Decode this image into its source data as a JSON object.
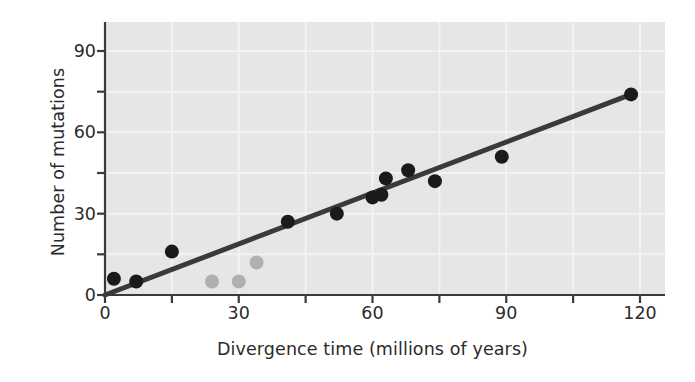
{
  "chart_data": {
    "type": "scatter",
    "title": "",
    "xlabel": "Divergence time (millions of years)",
    "ylabel": "Number of mutations",
    "xlim": [
      0,
      130
    ],
    "ylim": [
      0,
      100
    ],
    "xticks": [
      0,
      15,
      30,
      45,
      60,
      75,
      90,
      105,
      120
    ],
    "xtick_labels": [
      "0",
      "",
      "30",
      "",
      "60",
      "",
      "90",
      "",
      "120"
    ],
    "yticks": [
      0,
      15,
      30,
      45,
      60,
      75,
      90
    ],
    "ytick_labels": [
      "0",
      "",
      "30",
      "",
      "60",
      "",
      "90"
    ],
    "grid": true,
    "grid_color": "#f2f2f2",
    "plot_background": "#e6e6e6",
    "series": [
      {
        "name": "primate comparisons",
        "marker": "filled-circle",
        "color": "#1a1a1a",
        "points": [
          {
            "x": 2,
            "y": 6
          },
          {
            "x": 7,
            "y": 5
          },
          {
            "x": 15,
            "y": 16
          },
          {
            "x": 41,
            "y": 27
          },
          {
            "x": 52,
            "y": 30
          },
          {
            "x": 60,
            "y": 36
          },
          {
            "x": 62,
            "y": 37
          },
          {
            "x": 63,
            "y": 43
          },
          {
            "x": 68,
            "y": 46
          },
          {
            "x": 74,
            "y": 42
          },
          {
            "x": 89,
            "y": 51
          },
          {
            "x": 118,
            "y": 74
          }
        ]
      },
      {
        "name": "outlier comparisons",
        "marker": "filled-circle",
        "color": "#b0b0b0",
        "points": [
          {
            "x": 24,
            "y": 5
          },
          {
            "x": 30,
            "y": 5
          },
          {
            "x": 34,
            "y": 12
          }
        ]
      }
    ],
    "trendline": {
      "name": "molecular clock fit",
      "color": "#3a3a3a",
      "x_start": 0,
      "y_start": 0,
      "x_end": 118,
      "y_end": 74,
      "slope": 0.627,
      "intercept": 0
    }
  }
}
